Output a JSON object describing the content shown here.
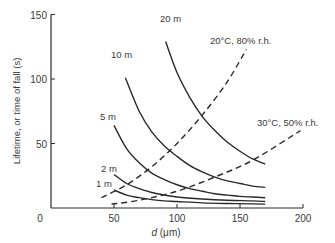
{
  "chart_data": {
    "type": "line",
    "title": "",
    "xlabel": "d (μm)",
    "ylabel": "Lifetime, or time of fall (s)",
    "xlim": [
      0,
      200
    ],
    "ylim": [
      0,
      150
    ],
    "xticks": [
      0,
      50,
      100,
      150,
      200
    ],
    "yticks": [
      0,
      50,
      100,
      150
    ],
    "grid": false,
    "legend": "none (curves labelled inline)",
    "series": [
      {
        "name": "20 m",
        "style": "solid",
        "x": [
          91,
          100,
          110,
          120,
          130,
          140,
          150,
          160,
          170
        ],
        "y": [
          129,
          105,
          86,
          71,
          60,
          51,
          44,
          38,
          34
        ]
      },
      {
        "name": "10 m",
        "style": "solid",
        "x": [
          59,
          70,
          80,
          90,
          100,
          110,
          120,
          130,
          140,
          150,
          160,
          170
        ],
        "y": [
          101,
          75,
          59,
          48,
          40,
          33,
          28,
          24,
          21,
          19,
          17,
          16
        ]
      },
      {
        "name": "5 m",
        "style": "solid",
        "x": [
          50,
          60,
          70,
          80,
          90,
          100,
          110,
          120,
          130,
          140,
          150,
          160,
          170
        ],
        "y": [
          64,
          46,
          35,
          27,
          22,
          18,
          15,
          13,
          11,
          10,
          9,
          8.5,
          8
        ]
      },
      {
        "name": "2 m",
        "style": "solid",
        "x": [
          50,
          60,
          70,
          80,
          90,
          100,
          120,
          140,
          160,
          170
        ],
        "y": [
          26,
          19,
          15,
          12,
          10,
          8.5,
          7,
          6,
          5.5,
          5
        ]
      },
      {
        "name": "1 m",
        "style": "solid",
        "x": [
          50,
          60,
          70,
          80,
          90,
          100,
          120,
          140,
          160,
          170
        ],
        "y": [
          14,
          10,
          8,
          6.5,
          5.5,
          5,
          4,
          3.5,
          3.2,
          3
        ]
      },
      {
        "name": "20°C, 80% r.h.",
        "style": "dashed",
        "x": [
          40,
          60,
          80,
          100,
          120,
          140,
          155
        ],
        "y": [
          8,
          18,
          32,
          50,
          72,
          98,
          123
        ]
      },
      {
        "name": "30°C, 50% r.h.",
        "style": "dashed",
        "x": [
          48,
          70,
          100,
          130,
          160,
          198
        ],
        "y": [
          3,
          6,
          13,
          24,
          37,
          60
        ]
      }
    ],
    "annotations": [
      "20 m",
      "10 m",
      "5 m",
      "2 m",
      "1 m",
      "20°C, 80% r.h.",
      "30°C, 50% r.h."
    ]
  },
  "labels": {
    "xlabel_d": "d",
    "xlabel_unit": " (μm)",
    "ylabel": "Lifetime, or time of fall (s)",
    "x0": "0",
    "y0": "0"
  }
}
